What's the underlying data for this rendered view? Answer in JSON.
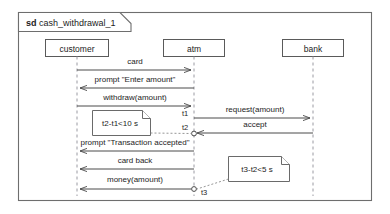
{
  "frame": {
    "keyword": "sd",
    "name": "cash_withdrawal_1"
  },
  "colors": {
    "frame_border": "#6e6e6e",
    "box_border": "#5a5a5a",
    "lifeline": "#9a9aa2",
    "message": "#4a4a4a",
    "note_border": "#6a6a6a",
    "background": "#ffffff",
    "text": "#1c1c1c"
  },
  "lifelines": [
    {
      "id": "customer",
      "label": "customer"
    },
    {
      "id": "atm",
      "label": "atm"
    },
    {
      "id": "bank",
      "label": "bank"
    }
  ],
  "messages": [
    {
      "label": "card",
      "from": "customer",
      "to": "atm",
      "direction": "right"
    },
    {
      "label": "prompt \"Enter amount\"",
      "from": "atm",
      "to": "customer",
      "direction": "left"
    },
    {
      "label": "withdraw(amount)",
      "from": "customer",
      "to": "atm",
      "direction": "right"
    },
    {
      "label": "request(amount)",
      "from": "atm",
      "to": "bank",
      "direction": "right"
    },
    {
      "label": "accept",
      "from": "bank",
      "to": "atm",
      "direction": "left"
    },
    {
      "label": "prompt \"Transaction accepted\"",
      "from": "atm",
      "to": "customer",
      "direction": "left"
    },
    {
      "label": "card back",
      "from": "atm",
      "to": "customer",
      "direction": "left"
    },
    {
      "label": "money(amount)",
      "from": "atm",
      "to": "customer",
      "direction": "left"
    }
  ],
  "time_marks": [
    {
      "label": "t1",
      "on": "atm"
    },
    {
      "label": "t2",
      "on": "atm"
    },
    {
      "label": "t3",
      "on": "atm"
    }
  ],
  "notes": [
    {
      "id": "note-1",
      "text": "t2-t1<10 s",
      "anchor": "t2"
    },
    {
      "id": "note-2",
      "text": "t3-t2<5 s",
      "anchor": "t3"
    }
  ]
}
